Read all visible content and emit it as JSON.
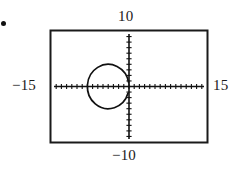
{
  "figure": {
    "bullet": "•",
    "labels": {
      "y_max": "10",
      "y_min": "−10",
      "x_min": "−15",
      "x_max": "15"
    }
  },
  "chart_data": {
    "type": "scatter",
    "title": "",
    "subtitle": "",
    "xlabel": "",
    "ylabel": "",
    "xlim": [
      -15,
      15
    ],
    "ylim": [
      -10,
      10
    ],
    "grid": false,
    "legend": "none",
    "tick_labels": {
      "x": [
        "−15",
        "15"
      ],
      "y": [
        "−10",
        "10"
      ]
    },
    "tick_spacing": {
      "x": 1,
      "y": 1
    },
    "axis_style": "calculator-viewing-window",
    "annotations": [
      "Graphing calculator viewing window [−15, 15] by [−10, 10]"
    ],
    "series": [
      {
        "name": "circle",
        "shape": "circle",
        "center": [
          -4,
          0
        ],
        "radius": 4,
        "note": "closed curve (circle) centered near (−4, 0) with radius 4, drawn with a small gap at upper right"
      }
    ]
  },
  "colors": {
    "ink": "#111111",
    "background": "#ffffff",
    "frame": "#1a1a1a"
  }
}
